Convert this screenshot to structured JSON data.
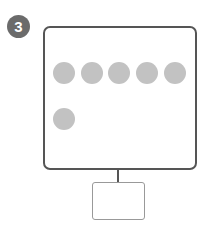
{
  "step": {
    "number": "3",
    "badge_color": "#6b6b6b"
  },
  "diagram": {
    "container": {
      "border_color": "#555555"
    },
    "dots": {
      "color": "#c2c2c2",
      "rows": [
        {
          "count": 5
        },
        {
          "count": 1
        }
      ]
    },
    "connector": {
      "color": "#555555"
    },
    "child_box": {
      "border_color": "#999999"
    }
  }
}
